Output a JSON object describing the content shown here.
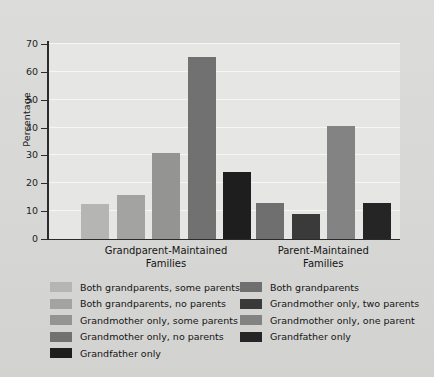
{
  "chart_data": {
    "type": "bar",
    "title": "",
    "xlabel": "",
    "ylabel": "Percentage",
    "ylim": [
      0,
      70
    ],
    "yticks": [
      0,
      10,
      20,
      30,
      40,
      50,
      60,
      70
    ],
    "grid": true,
    "legend_position": "bottom",
    "categories": [
      "Grandparent-Maintained Families",
      "Parent-Maintained Families"
    ],
    "groups": [
      {
        "category": "Grandparent-Maintained",
        "category_line1": "Grandparent-Maintained",
        "category_line2": "Families",
        "bars": [
          {
            "label": "Both grandparents, some parents",
            "value": 12.7,
            "color": "#b5b5b3"
          },
          {
            "label": "Both grandparents, no parents",
            "value": 15.7,
            "color": "#a3a3a1"
          },
          {
            "label": "Grandmother only, some parents",
            "value": 31.0,
            "color": "#949492"
          },
          {
            "label": "Grandmother only, no parents",
            "value": 65.2,
            "color": "#717171"
          },
          {
            "label": "Grandfather only",
            "value": 24.0,
            "color": "#1e1e1e"
          }
        ]
      },
      {
        "category": "Parent-Maintained",
        "category_line1": "Parent-Maintained",
        "category_line2": "Families",
        "bars": [
          {
            "label": "Both grandparents",
            "value": 12.8,
            "color": "#6f6f6f"
          },
          {
            "label": "Grandmother only, two parents",
            "value": 8.9,
            "color": "#3a3a3a"
          },
          {
            "label": "Grandmother only, one parent",
            "value": 40.5,
            "color": "#838383"
          },
          {
            "label": "Grandfather only",
            "value": 13.0,
            "color": "#252525"
          }
        ]
      }
    ],
    "legend": {
      "left_column": [
        {
          "label": "Both grandparents, some parents",
          "color": "#b5b5b3"
        },
        {
          "label": "Both grandparents, no parents",
          "color": "#a3a3a1"
        },
        {
          "label": "Grandmother only, some parents",
          "color": "#949492"
        },
        {
          "label": "Grandmother only, no parents",
          "color": "#717171"
        },
        {
          "label": "Grandfather only",
          "color": "#1e1e1e"
        }
      ],
      "right_column": [
        {
          "label": "Both grandparents",
          "color": "#6f6f6f"
        },
        {
          "label": "Grandmother only, two parents",
          "color": "#3a3a3a"
        },
        {
          "label": "Grandmother only, one parent",
          "color": "#838383"
        },
        {
          "label": "Grandfather only",
          "color": "#252525"
        }
      ]
    },
    "colors": {
      "plot_background": "#e6e6e4",
      "figure_background": "#d9d9d7",
      "gridline": "#f6f6f4",
      "axis": "#2b2b2b",
      "text": "#141414"
    }
  }
}
